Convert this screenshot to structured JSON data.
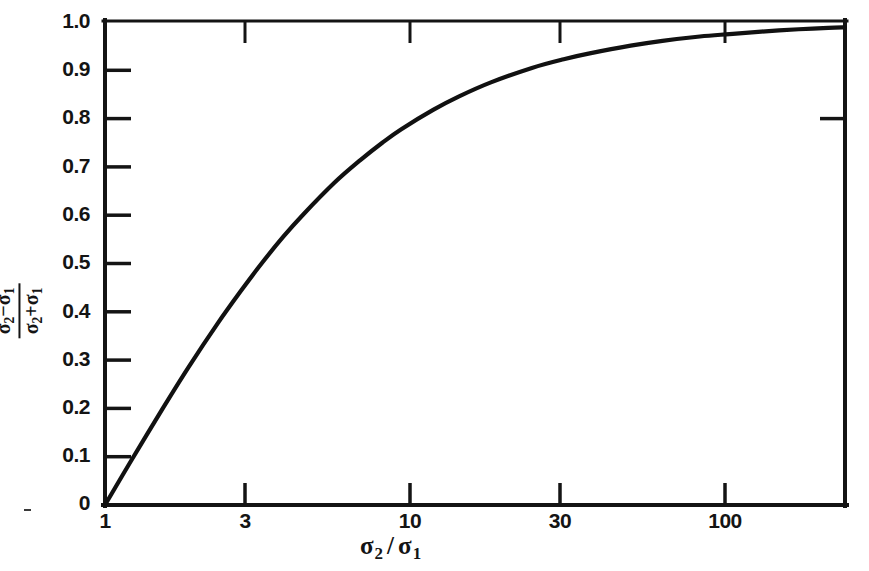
{
  "figure": {
    "background_color": "#ffffff",
    "ink_color": "#141414",
    "curve_color": "#111111"
  },
  "chart_data": {
    "type": "line",
    "title": "",
    "subtitle": "",
    "xlabel": "σ₂ / σ₁",
    "ylabel": "(σ₂ − σ₁) / (σ₂ + σ₁)",
    "xscale": "log",
    "yscale": "linear",
    "xlim": [
      1,
      180
    ],
    "ylim": [
      0,
      1.0
    ],
    "grid": false,
    "legend": null,
    "x_tick_values": [
      1,
      3,
      10,
      30,
      100
    ],
    "x_tick_labels": [
      "1",
      "3",
      "10",
      "30",
      "100"
    ],
    "y_tick_values": [
      0,
      0.1,
      0.2,
      0.3,
      0.4,
      0.5,
      0.6,
      0.7,
      0.8,
      0.9,
      1.0
    ],
    "y_tick_labels": [
      "0",
      "0.1",
      "0.2",
      "0.3",
      "0.4",
      "0.5",
      "0.6",
      "0.7",
      "0.8",
      "0.9",
      "1.0"
    ],
    "series": [
      {
        "name": "(σ₂−σ₁)/(σ₂+σ₁)",
        "x": [
          1,
          1.2,
          1.5,
          1.8,
          2.2,
          2.6,
          3,
          3.5,
          4,
          5,
          6,
          7,
          8,
          10,
          12,
          15,
          20,
          25,
          30,
          40,
          50,
          65,
          80,
          100,
          130,
          160,
          180
        ],
        "y": [
          0.0,
          0.091,
          0.2,
          0.286,
          0.375,
          0.444,
          0.5,
          0.556,
          0.6,
          0.667,
          0.714,
          0.75,
          0.778,
          0.818,
          0.846,
          0.875,
          0.905,
          0.923,
          0.935,
          0.951,
          0.961,
          0.97,
          0.975,
          0.98,
          0.985,
          0.988,
          0.989
        ]
      }
    ]
  },
  "axis_labels": {
    "y": [
      {
        "text": "1.0",
        "value": 1.0
      },
      {
        "text": "0.9",
        "value": 0.9
      },
      {
        "text": "0.8",
        "value": 0.8
      },
      {
        "text": "0.7",
        "value": 0.7
      },
      {
        "text": "0.6",
        "value": 0.6
      },
      {
        "text": "0.5",
        "value": 0.5
      },
      {
        "text": "0.4",
        "value": 0.4
      },
      {
        "text": "0.3",
        "value": 0.3
      },
      {
        "text": "0.2",
        "value": 0.2
      },
      {
        "text": "0.1",
        "value": 0.1
      },
      {
        "text": "0",
        "value": 0.0
      }
    ],
    "x": [
      {
        "text": "1",
        "value": 1
      },
      {
        "text": "3",
        "value": 3
      },
      {
        "text": "10",
        "value": 10
      },
      {
        "text": "30",
        "value": 30
      },
      {
        "text": "100",
        "value": 100
      }
    ]
  },
  "y_title": {
    "numerator_sigma_a": "σ",
    "numerator_sub_a": "2",
    "numerator_op": "−",
    "numerator_sigma_b": "σ",
    "numerator_sub_b": "1",
    "denominator_sigma_a": "σ",
    "denominator_sub_a": "2",
    "denominator_op": "+",
    "denominator_sigma_b": "σ",
    "denominator_sub_b": "1"
  },
  "x_title": {
    "sigma_a": "σ",
    "sub_a": "2",
    "slash": "/",
    "sigma_b": "σ",
    "sub_b": "1"
  }
}
